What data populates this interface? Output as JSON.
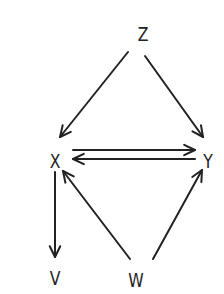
{
  "diagram": {
    "type": "directed-graph",
    "colors": {
      "ink": "#222222",
      "background": "#ffffff"
    },
    "nodes": [
      {
        "id": "Z",
        "label": "Z",
        "x": 143,
        "y": 34
      },
      {
        "id": "X",
        "label": "X",
        "x": 55,
        "y": 161
      },
      {
        "id": "Y",
        "label": "Y",
        "x": 208,
        "y": 161
      },
      {
        "id": "V",
        "label": "V",
        "x": 55,
        "y": 278
      },
      {
        "id": "W",
        "label": "W",
        "x": 136,
        "y": 280
      }
    ],
    "edges": [
      {
        "from": "Z",
        "to": "X",
        "x1": 128,
        "y1": 52,
        "x2": 60,
        "y2": 137
      },
      {
        "from": "Z",
        "to": "Y",
        "x1": 145,
        "y1": 56,
        "x2": 203,
        "y2": 137
      },
      {
        "from": "X",
        "to": "Y",
        "x1": 73,
        "y1": 150,
        "x2": 195,
        "y2": 150
      },
      {
        "from": "Y",
        "to": "X",
        "x1": 195,
        "y1": 159,
        "x2": 73,
        "y2": 159
      },
      {
        "from": "X",
        "to": "V",
        "x1": 55,
        "y1": 172,
        "x2": 55,
        "y2": 257
      },
      {
        "from": "W",
        "to": "X",
        "x1": 130,
        "y1": 259,
        "x2": 63,
        "y2": 171
      },
      {
        "from": "W",
        "to": "Y",
        "x1": 153,
        "y1": 259,
        "x2": 202,
        "y2": 170
      }
    ]
  }
}
